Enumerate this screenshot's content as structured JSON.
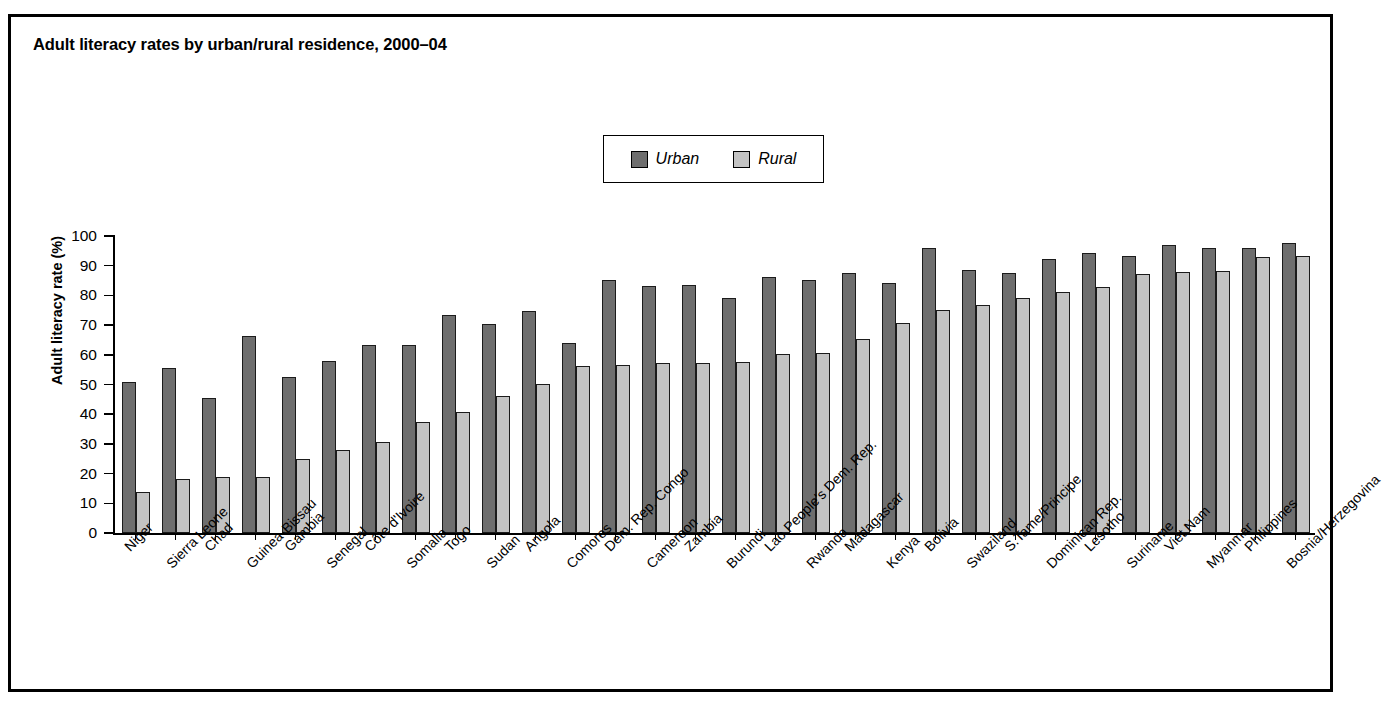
{
  "figure": {
    "title": "Adult literacy rates by urban/rural residence, 2000–04"
  },
  "legend": {
    "position": "top-center",
    "items": [
      {
        "label": "Urban",
        "color": "#6e6e6e",
        "icon": "legend-swatch-urban"
      },
      {
        "label": "Rural",
        "color": "#c3c3c3",
        "icon": "legend-swatch-rural"
      }
    ]
  },
  "axes": {
    "ylabel": "Adult literacy rate (%)",
    "xlabel": "",
    "yticks": [
      0,
      10,
      20,
      30,
      40,
      50,
      60,
      70,
      80,
      90,
      100
    ],
    "ylim": [
      0,
      100
    ],
    "grid": false
  },
  "chart_data": {
    "type": "bar",
    "title": "Adult literacy rates by urban/rural residence, 2000–04",
    "xlabel": "",
    "ylabel": "Adult literacy rate (%)",
    "ylim": [
      0,
      100
    ],
    "yticks": [
      0,
      10,
      20,
      30,
      40,
      50,
      60,
      70,
      80,
      90,
      100
    ],
    "grid": false,
    "legend_position": "top-center",
    "categories": [
      "Niger",
      "Sierra Leone",
      "Chad",
      "Guinea-Bissau",
      "Gambia",
      "Senegal",
      "Côte d'Ivoire",
      "Somalia",
      "Togo",
      "Sudan",
      "Angola",
      "Comores",
      "Dem. Rep. Congo",
      "Cameroon",
      "Zambia",
      "Burundi",
      "Lao People's Dem. Rep.",
      "Rwanda",
      "Madagascar",
      "Kenya",
      "Bolivia",
      "Swaziland",
      "S.Tame/Principe",
      "Dominican Rep.",
      "Lesotho",
      "Suriname",
      "Viet Nam",
      "Myanmar",
      "Philippines",
      "Bosnia/Herzegovina"
    ],
    "series": [
      {
        "name": "Urban",
        "color": "#6e6e6e",
        "values": [
          50.8,
          55.5,
          45.5,
          66.3,
          52.5,
          58.0,
          63.2,
          63.2,
          73.3,
          70.5,
          74.6,
          64.0,
          85.3,
          83.3,
          83.4,
          79.2,
          86.3,
          85.1,
          87.5,
          84.2,
          96.1,
          88.6,
          87.7,
          92.4,
          94.4,
          93.4,
          96.9,
          95.8,
          96.0,
          97.5
        ]
      },
      {
        "name": "Rural",
        "color": "#c3c3c3",
        "values": [
          13.7,
          18.3,
          18.8,
          19.0,
          25.0,
          27.9,
          30.5,
          37.4,
          40.7,
          46.2,
          50.3,
          56.2,
          56.5,
          57.2,
          57.3,
          57.5,
          60.3,
          60.5,
          65.4,
          70.8,
          75.2,
          76.8,
          79.1,
          81.2,
          82.9,
          87.3,
          87.9,
          88.2,
          92.8,
          93.3
        ]
      }
    ]
  }
}
